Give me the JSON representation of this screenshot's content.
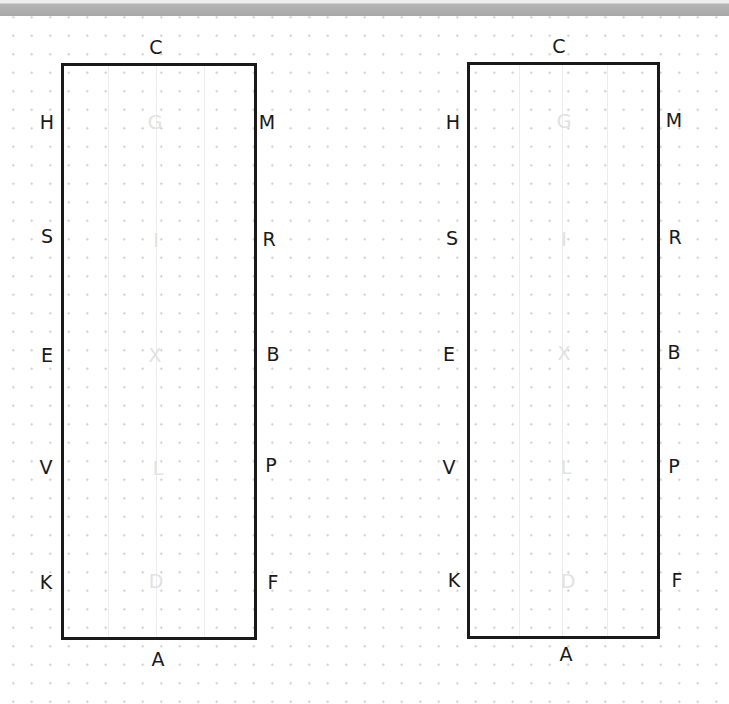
{
  "diagram": {
    "arenas": [
      {
        "name": "left",
        "top_letter": "C",
        "bottom_letter": "A",
        "left_letters": [
          "H",
          "S",
          "E",
          "V",
          "K"
        ],
        "right_letters": [
          "M",
          "R",
          "B",
          "P",
          "F"
        ],
        "centerline_letters": [
          "G",
          "I",
          "X",
          "L",
          "D"
        ]
      },
      {
        "name": "right",
        "top_letter": "C",
        "bottom_letter": "A",
        "left_letters": [
          "H",
          "S",
          "E",
          "V",
          "K"
        ],
        "right_letters": [
          "M",
          "R",
          "B",
          "P",
          "F"
        ],
        "centerline_letters": [
          "G",
          "I",
          "X",
          "L",
          "D"
        ]
      }
    ],
    "colors": {
      "border": "#1a1a1a",
      "letters": "#1a1a1a",
      "inner_letters": "#e2e2e2",
      "grid_dots": "#c8c8c8",
      "top_bar": "#a8a8a8"
    }
  }
}
